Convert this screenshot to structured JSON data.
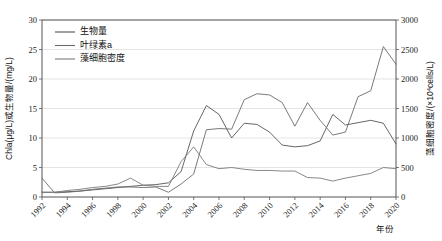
{
  "chart_data": {
    "type": "line",
    "title": "",
    "xlabel": "年份",
    "ylabel": "Chla(μg/L)或生物量/(mg/L)",
    "ylabel_right": "藻细胞密度/(×10⁴cells/L)",
    "xlim": [
      1992,
      2020
    ],
    "ylim": [
      0,
      30
    ],
    "ylim_right": [
      0,
      3000
    ],
    "grid": true,
    "legend_position": "top-left",
    "x": [
      1992,
      1993,
      1994,
      1995,
      1996,
      1997,
      1998,
      1999,
      2000,
      2001,
      2002,
      2003,
      2004,
      2005,
      2006,
      2007,
      2008,
      2009,
      2010,
      2011,
      2012,
      2013,
      2014,
      2015,
      2016,
      2017,
      2018,
      2019,
      2020
    ],
    "xticks": [
      "1992",
      "1994",
      "1996",
      "1998",
      "2000",
      "2002",
      "2004",
      "2006",
      "2008",
      "2010",
      "2012",
      "2014",
      "2016",
      "2018",
      "2020"
    ],
    "yticks_left": [
      "0",
      "5",
      "10",
      "15",
      "20",
      "25",
      "30"
    ],
    "yticks_right": [
      "0",
      "500",
      "1000",
      "1500",
      "2000",
      "2500",
      "3000"
    ],
    "series": [
      {
        "name": "生物量",
        "axis": "left",
        "color": "#555555",
        "values": [
          0.8,
          0.8,
          0.9,
          1.0,
          1.2,
          1.4,
          1.6,
          1.8,
          2.0,
          2.1,
          2.4,
          4.3,
          11.2,
          15.5,
          14.0,
          10.0,
          12.5,
          12.3,
          11.0,
          8.8,
          8.5,
          8.7,
          9.5,
          14.0,
          12.2,
          12.6,
          13.0,
          12.5,
          9.0
        ]
      },
      {
        "name": "叶绿素a",
        "axis": "left",
        "color": "#6b6b6b",
        "values": [
          3.2,
          0.7,
          0.8,
          1.0,
          1.3,
          1.5,
          1.7,
          1.7,
          1.6,
          1.7,
          0.8,
          2.2,
          3.9,
          11.4,
          11.6,
          11.5,
          16.5,
          17.5,
          17.3,
          16.0,
          12.0,
          16.0,
          13.0,
          10.5,
          11.0,
          17.0,
          18.0,
          25.5,
          22.5
        ]
      },
      {
        "name": "藻细胞密度",
        "axis": "left",
        "color": "#7a7a7a",
        "values": [
          0.8,
          0.8,
          1.1,
          1.3,
          1.6,
          1.8,
          2.2,
          3.2,
          2.0,
          1.8,
          1.8,
          6.0,
          8.5,
          5.5,
          4.8,
          5.0,
          4.7,
          4.5,
          4.5,
          4.4,
          4.4,
          3.3,
          3.2,
          2.7,
          3.2,
          3.6,
          4.0,
          5.0,
          4.8
        ]
      }
    ]
  },
  "legend": {
    "items": [
      {
        "label": "生物量"
      },
      {
        "label": "叶绿素a"
      },
      {
        "label": "藻细胞密度"
      }
    ]
  },
  "axes": {
    "left_title": "Chla(μg/L)或生物量/(mg/L)",
    "right_title_pre": "藻细胞密度/(×10",
    "right_title_sup": "4",
    "right_title_post": "cells/L)",
    "x_title": "年份"
  }
}
